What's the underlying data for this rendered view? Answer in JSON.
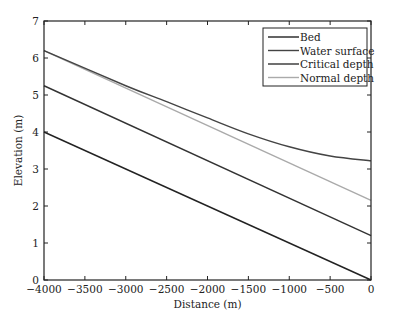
{
  "chart_data": {
    "type": "line",
    "title": "",
    "xlabel": "Distance (m)",
    "ylabel": "Elevation (m)",
    "xlim": [
      -4000,
      0
    ],
    "ylim": [
      0,
      7
    ],
    "xticks": [
      -4000,
      -3500,
      -3000,
      -2500,
      -2000,
      -1500,
      -1000,
      -500,
      0
    ],
    "xtick_labels": [
      "−4000",
      "−3500",
      "−3000",
      "−2500",
      "−2000",
      "−1500",
      "−1000",
      "−500",
      "0"
    ],
    "yticks": [
      0,
      1,
      2,
      3,
      4,
      5,
      6,
      7
    ],
    "grid": false,
    "legend_position": "upper right",
    "series": [
      {
        "name": "Bed",
        "color": "#222222",
        "x": [
          -4000,
          0
        ],
        "y": [
          4.0,
          0.0
        ]
      },
      {
        "name": "Water surface",
        "color": "#444444",
        "x": [
          -4000,
          -3000,
          -2500,
          -2000,
          -1500,
          -1000,
          -500,
          0
        ],
        "y": [
          6.2,
          5.25,
          4.82,
          4.38,
          3.95,
          3.6,
          3.35,
          3.22
        ]
      },
      {
        "name": "Critical depth",
        "color": "#333333",
        "x": [
          -4000,
          0
        ],
        "y": [
          5.25,
          1.2
        ]
      },
      {
        "name": "Normal depth",
        "color": "#aaaaaa",
        "x": [
          -4000,
          0
        ],
        "y": [
          6.2,
          2.15
        ]
      }
    ]
  }
}
